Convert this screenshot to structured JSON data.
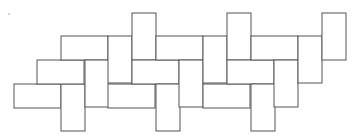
{
  "diagram": {
    "grid_unit": 1,
    "stroke_color": "#555555",
    "fill_color": "#ffffff",
    "tiles": [
      {
        "orientation": "horizontal",
        "col": 0,
        "row": 3
      },
      {
        "orientation": "vertical",
        "col": 2,
        "row": 3
      },
      {
        "orientation": "horizontal",
        "col": 1,
        "row": 2
      },
      {
        "orientation": "horizontal",
        "col": 2,
        "row": 1
      },
      {
        "orientation": "vertical",
        "col": 3,
        "row": 2
      },
      {
        "orientation": "vertical",
        "col": 4,
        "row": 1
      },
      {
        "orientation": "vertical",
        "col": 5,
        "row": 0
      },
      {
        "orientation": "horizontal",
        "col": 4,
        "row": 3
      },
      {
        "orientation": "horizontal",
        "col": 5,
        "row": 2
      },
      {
        "orientation": "horizontal",
        "col": 6,
        "row": 1
      },
      {
        "orientation": "vertical",
        "col": 6,
        "row": 3
      },
      {
        "orientation": "vertical",
        "col": 7,
        "row": 2
      },
      {
        "orientation": "vertical",
        "col": 8,
        "row": 1
      },
      {
        "orientation": "vertical",
        "col": 9,
        "row": 0
      },
      {
        "orientation": "horizontal",
        "col": 8,
        "row": 3
      },
      {
        "orientation": "horizontal",
        "col": 9,
        "row": 2
      },
      {
        "orientation": "horizontal",
        "col": 10,
        "row": 1
      },
      {
        "orientation": "vertical",
        "col": 10,
        "row": 3
      },
      {
        "orientation": "vertical",
        "col": 11,
        "row": 2
      },
      {
        "orientation": "vertical",
        "col": 12,
        "row": 1
      },
      {
        "orientation": "vertical",
        "col": 13,
        "row": 0
      }
    ]
  }
}
